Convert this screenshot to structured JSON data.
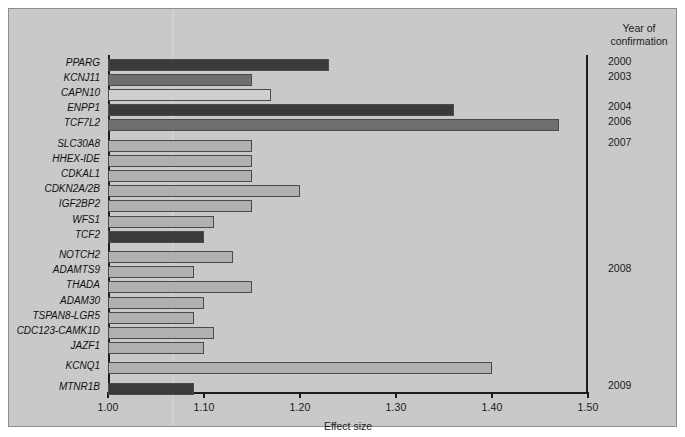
{
  "chart_data": {
    "type": "bar",
    "orientation": "horizontal",
    "title": "",
    "xlabel": "Effect size",
    "ylabel": "",
    "xlim": [
      1.0,
      1.5
    ],
    "xticks": [
      "1.00",
      "1.10",
      "1.20",
      "1.30",
      "1.40",
      "1.50"
    ],
    "xtick_values": [
      1.0,
      1.1,
      1.2,
      1.3,
      1.4,
      1.5
    ],
    "grid": false,
    "legend": null,
    "categories": [
      "PPARG",
      "KCNJ11",
      "CAPN10",
      "ENPP1",
      "TCF7L2",
      "SLC30A8",
      "HHEX-IDE",
      "CDKAL1",
      "CDKN2A/2B",
      "IGF2BP2",
      "WFS1",
      "TCF2",
      "NOTCH2",
      "ADAMTS9",
      "THADA",
      "ADAM30",
      "TSPAN8-LGR5",
      "CDC123-CAMK1D",
      "JAZF1",
      "KCNQ1",
      "MTNR1B"
    ],
    "values": [
      1.23,
      1.15,
      1.17,
      1.36,
      1.47,
      1.15,
      1.15,
      1.15,
      1.2,
      1.15,
      1.11,
      1.1,
      1.13,
      1.09,
      1.15,
      1.1,
      1.09,
      1.11,
      1.1,
      1.4,
      1.09
    ],
    "bar_shades": [
      "dark",
      "mid",
      "light-white",
      "dark",
      "mid",
      "light",
      "light",
      "light",
      "light",
      "light",
      "light",
      "dark",
      "light",
      "light",
      "light",
      "light",
      "light",
      "light",
      "light",
      "light",
      "dark"
    ]
  },
  "year_column": {
    "header_line1": "Year of",
    "header_line2": "confirmation",
    "entries": [
      {
        "year": "2000",
        "row": 0
      },
      {
        "year": "2003",
        "row": 1
      },
      {
        "year": "2004",
        "row": 3
      },
      {
        "year": "2006",
        "row": 4
      },
      {
        "year": "2007",
        "row": 5
      },
      {
        "year": "2008",
        "row": 13
      },
      {
        "year": "2009",
        "row": 20
      }
    ]
  },
  "colors": {
    "panel_background": "#c9c9c9",
    "axis": "#1b1b1b",
    "bar_dark": "#3b3b3b",
    "bar_mid": "#6e6e6e",
    "bar_light": "#b0b0b0",
    "bar_light_white": "#cfcfcf",
    "bar_outline": "#4a4a4a",
    "text": "#101010"
  }
}
